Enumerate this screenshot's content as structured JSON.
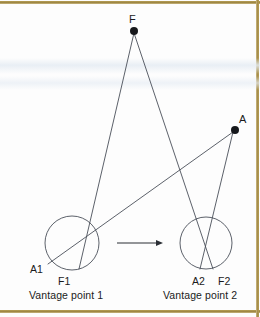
{
  "figure": {
    "background_color": "#fdfdfd",
    "ink_color": "#3a3f4a",
    "rule_color": "#a38a47",
    "labels": {
      "far_point": "F",
      "near_point": "A",
      "vp1_a": "A1",
      "vp1_f": "F1",
      "vp2_a": "A2",
      "vp2_f": "F2",
      "caption_left": "Vantage point 1",
      "caption_right": "Vantage point 2"
    },
    "points": {
      "F": {
        "x": 134,
        "y": 31,
        "radius": 4
      },
      "A": {
        "x": 235,
        "y": 130,
        "radius": 4
      }
    },
    "circles": [
      {
        "name": "eye-left",
        "cx": 72,
        "cy": 243,
        "r": 27
      },
      {
        "name": "eye-right",
        "cx": 206,
        "cy": 243,
        "r": 26
      }
    ],
    "rays": [
      {
        "name": "F-to-vp1",
        "x1": 134,
        "y1": 31,
        "x2": 79,
        "y2": 269
      },
      {
        "name": "F-to-vp2",
        "x1": 134,
        "y1": 31,
        "x2": 213,
        "y2": 269
      },
      {
        "name": "A-to-vp1",
        "x1": 235,
        "y1": 130,
        "x2": 48,
        "y2": 264
      },
      {
        "name": "A-to-vp2",
        "x1": 235,
        "y1": 130,
        "x2": 200,
        "y2": 269
      }
    ],
    "arrow": {
      "name": "motion-arrow",
      "x1": 117,
      "y1": 243,
      "x2": 163,
      "y2": 243
    }
  }
}
